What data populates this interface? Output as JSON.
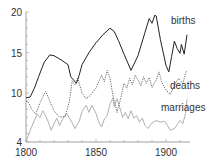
{
  "chart_data": {
    "type": "line",
    "title": "",
    "xlabel": "",
    "ylabel": "",
    "xlim": [
      1800,
      1916
    ],
    "ylim": [
      4,
      20
    ],
    "grid": false,
    "legend": "inline labels",
    "x_ticks": [
      1800,
      1850,
      1900
    ],
    "y_ticks": [
      4,
      10,
      15,
      20
    ],
    "series": [
      {
        "name": "births",
        "style": "solid",
        "color": "#222222",
        "points": [
          [
            1800,
            9.4
          ],
          [
            1803,
            9.5
          ],
          [
            1806,
            10.6
          ],
          [
            1809,
            12
          ],
          [
            1813,
            13.8
          ],
          [
            1817,
            14.7
          ],
          [
            1820,
            14.6
          ],
          [
            1825,
            14.1
          ],
          [
            1830,
            13.5
          ],
          [
            1832,
            12
          ],
          [
            1834,
            11.6
          ],
          [
            1836,
            11.2
          ],
          [
            1838,
            12.2
          ],
          [
            1840,
            13.5
          ],
          [
            1845,
            15
          ],
          [
            1850,
            16.2
          ],
          [
            1855,
            17.2
          ],
          [
            1860,
            18
          ],
          [
            1863,
            17.6
          ],
          [
            1866,
            16.5
          ],
          [
            1870,
            14.8
          ],
          [
            1875,
            12.8
          ],
          [
            1880,
            14.6
          ],
          [
            1885,
            17.5
          ],
          [
            1888,
            19.2
          ],
          [
            1890,
            18.6
          ],
          [
            1892,
            19.6
          ],
          [
            1893,
            19.5
          ],
          [
            1896,
            16.6
          ],
          [
            1900,
            13.4
          ],
          [
            1902,
            12.6
          ],
          [
            1904,
            14.5
          ],
          [
            1906,
            16.4
          ],
          [
            1908,
            15.5
          ],
          [
            1910,
            14.9
          ],
          [
            1911,
            16
          ],
          [
            1913,
            14.8
          ],
          [
            1915,
            17.2
          ]
        ]
      },
      {
        "name": "deaths",
        "style": "dotted",
        "color": "#555555",
        "points": [
          [
            1800,
            9
          ],
          [
            1802,
            8.8
          ],
          [
            1804,
            8
          ],
          [
            1807,
            7.4
          ],
          [
            1810,
            8.8
          ],
          [
            1814,
            10.2
          ],
          [
            1817,
            9
          ],
          [
            1820,
            7.8
          ],
          [
            1824,
            7
          ],
          [
            1828,
            7.1
          ],
          [
            1831,
            9
          ],
          [
            1833,
            11.5
          ],
          [
            1835,
            11
          ],
          [
            1837,
            11.8
          ],
          [
            1840,
            10
          ],
          [
            1843,
            9.3
          ],
          [
            1846,
            9.7
          ],
          [
            1850,
            10.6
          ],
          [
            1854,
            12.2
          ],
          [
            1856,
            11.4
          ],
          [
            1858,
            12.8
          ],
          [
            1860,
            11.8
          ],
          [
            1862,
            9.8
          ],
          [
            1865,
            7.6
          ],
          [
            1868,
            9.6
          ],
          [
            1870,
            11.2
          ],
          [
            1872,
            10.6
          ],
          [
            1874,
            11.8
          ],
          [
            1876,
            11
          ],
          [
            1878,
            12.2
          ],
          [
            1880,
            11.6
          ],
          [
            1882,
            10.9
          ],
          [
            1884,
            12
          ],
          [
            1886,
            11.2
          ],
          [
            1888,
            11.9
          ],
          [
            1890,
            10.7
          ],
          [
            1893,
            11.6
          ],
          [
            1895,
            12.6
          ],
          [
            1897,
            11.3
          ],
          [
            1900,
            10.4
          ],
          [
            1903,
            9.8
          ],
          [
            1906,
            11
          ],
          [
            1909,
            11.8
          ],
          [
            1912,
            11.2
          ],
          [
            1914,
            12.4
          ],
          [
            1915,
            12.8
          ]
        ]
      },
      {
        "name": "marriages",
        "style": "solid",
        "color": "#aaaaaa",
        "points": [
          [
            1800,
            4
          ],
          [
            1803,
            5.4
          ],
          [
            1806,
            6.6
          ],
          [
            1808,
            7.4
          ],
          [
            1810,
            7
          ],
          [
            1812,
            7.8
          ],
          [
            1814,
            7.2
          ],
          [
            1816,
            6.4
          ],
          [
            1818,
            5.4
          ],
          [
            1820,
            6.2
          ],
          [
            1822,
            6.9
          ],
          [
            1824,
            6
          ],
          [
            1826,
            6.7
          ],
          [
            1829,
            7.5
          ],
          [
            1831,
            6.9
          ],
          [
            1833,
            6.3
          ],
          [
            1835,
            5.6
          ],
          [
            1838,
            6.5
          ],
          [
            1840,
            7.7
          ],
          [
            1843,
            8.5
          ],
          [
            1845,
            7.6
          ],
          [
            1847,
            8.5
          ],
          [
            1850,
            7.5
          ],
          [
            1852,
            6.4
          ],
          [
            1854,
            5.8
          ],
          [
            1856,
            6.8
          ],
          [
            1858,
            7.2
          ],
          [
            1860,
            8.6
          ],
          [
            1862,
            9.4
          ],
          [
            1863,
            8.3
          ],
          [
            1865,
            9.3
          ],
          [
            1867,
            8.2
          ],
          [
            1869,
            7
          ],
          [
            1871,
            7.6
          ],
          [
            1873,
            6.8
          ],
          [
            1875,
            7.8
          ],
          [
            1877,
            6.9
          ],
          [
            1879,
            7.2
          ],
          [
            1881,
            6.4
          ],
          [
            1883,
            6.9
          ],
          [
            1885,
            6
          ],
          [
            1887,
            5.6
          ],
          [
            1890,
            6.3
          ],
          [
            1893,
            6.6
          ],
          [
            1896,
            6.4
          ],
          [
            1899,
            6.5
          ],
          [
            1901,
            6
          ],
          [
            1903,
            5.4
          ],
          [
            1906,
            5.6
          ],
          [
            1908,
            6.1
          ],
          [
            1910,
            6.6
          ],
          [
            1912,
            6.2
          ],
          [
            1914,
            7.5
          ],
          [
            1915,
            9.2
          ]
        ]
      }
    ],
    "annotations": [
      {
        "text": "births",
        "x": 1898,
        "y": 18.2
      },
      {
        "text": "deaths",
        "x": 1898,
        "y": 11
      },
      {
        "text": "marriages",
        "x": 1893,
        "y": 7.3
      }
    ]
  },
  "labels": {
    "births": "births",
    "deaths": "deaths",
    "marriages": "marriages",
    "y_tick_4": "4",
    "y_tick_10": "10",
    "y_tick_15": "15",
    "y_tick_20": "20",
    "x_tick_1800": "1800",
    "x_tick_1850": "1850",
    "x_tick_1900": "1900"
  }
}
